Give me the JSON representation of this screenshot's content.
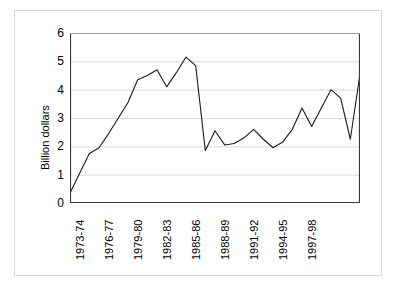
{
  "chart_data": {
    "type": "line",
    "title": "",
    "xlabel": "",
    "ylabel": "Billion dollars",
    "ylim": [
      0,
      6
    ],
    "yticks": [
      0,
      1,
      2,
      3,
      4,
      5,
      6
    ],
    "grid": true,
    "legend": false,
    "legend_position": "none",
    "line_color": "#1a1a1a",
    "categories": [
      "1973-74",
      "1974-75",
      "1975-76",
      "1976-77",
      "1977-78",
      "1978-79",
      "1979-80",
      "1980-81",
      "1981-82",
      "1982-83",
      "1983-84",
      "1984-85",
      "1985-86",
      "1986-87",
      "1987-88",
      "1988-89",
      "1989-90",
      "1990-91",
      "1991-92",
      "1992-93",
      "1993-94",
      "1994-95",
      "1995-96",
      "1996-97",
      "1997-98",
      "1998-99",
      "1999-00",
      "2000-01",
      "2001-02",
      "2002-03"
    ],
    "xtick_labels": [
      "1973-74",
      "1976-77",
      "1979-80",
      "1982-83",
      "1985-86",
      "1988-89",
      "1991-92",
      "1994-95",
      "1997-98"
    ],
    "xtick_indices": [
      0,
      3,
      6,
      9,
      12,
      15,
      18,
      21,
      24
    ],
    "values": [
      0.35,
      1.05,
      1.75,
      1.95,
      2.45,
      3.0,
      3.55,
      4.35,
      4.5,
      4.7,
      4.1,
      4.6,
      5.15,
      4.85,
      1.85,
      2.55,
      2.05,
      2.1,
      2.3,
      2.6,
      2.25,
      1.95,
      2.15,
      2.6,
      3.35,
      2.7,
      3.35,
      4.0,
      3.7,
      2.25
    ],
    "last_value": 4.55,
    "series_name": "Billion dollars",
    "n_points": 31,
    "peak": {
      "label": "1985-86",
      "value": 5.15
    },
    "minimum": {
      "label": "1973-74",
      "value": 0.35
    }
  }
}
